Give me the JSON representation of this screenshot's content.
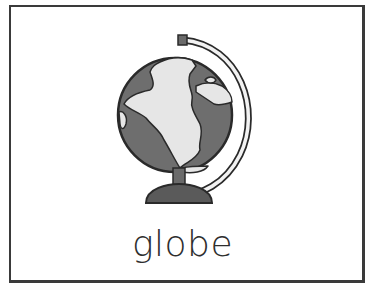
{
  "card": {
    "word": "globe",
    "image": {
      "subject": "globe-icon",
      "description": "desk globe on stand"
    }
  },
  "colors": {
    "border": "#3a3a3a",
    "ocean": "#6e6e6e",
    "land": "#e6e6e6",
    "outline": "#2a2a2a",
    "base": "#5a5a5a"
  }
}
